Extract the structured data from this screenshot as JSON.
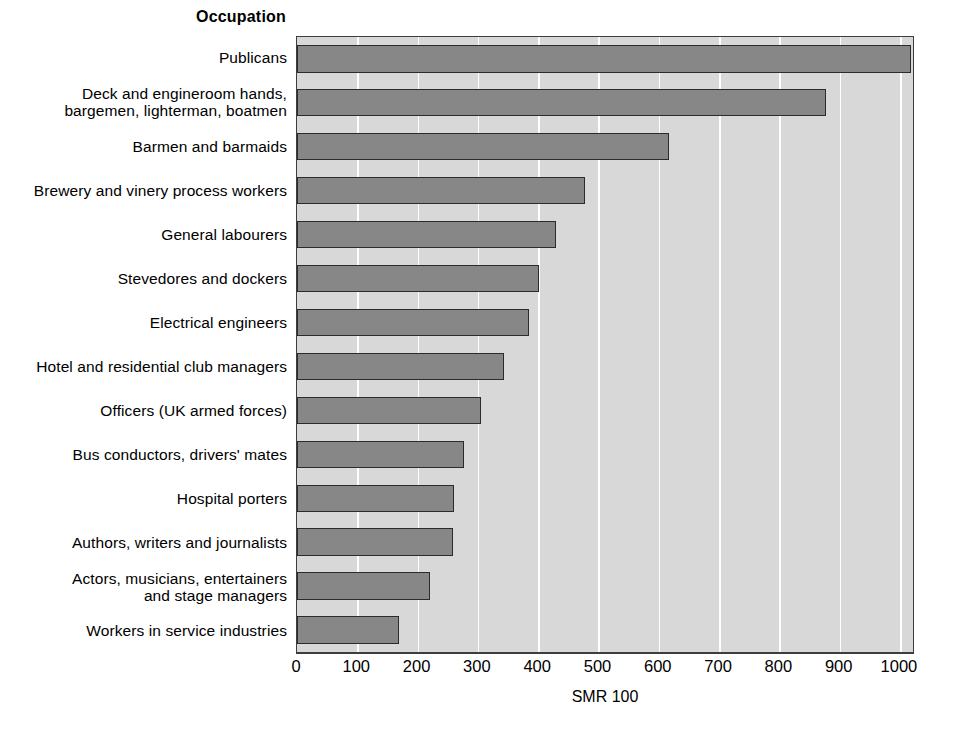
{
  "axes": {
    "category_axis_title": "Occupation",
    "x_axis_label": "SMR 100",
    "x_ticks": [
      "0",
      "100",
      "200",
      "300",
      "400",
      "500",
      "600",
      "700",
      "800",
      "900",
      "1000"
    ]
  },
  "colors": {
    "bar_fill": "#878787",
    "bar_border": "#2b2b2b",
    "plot_background": "#d8d8d8",
    "gridline": "#ffffff",
    "axis": "#3d3d3d",
    "text": "#000000"
  },
  "chart_data": {
    "type": "bar",
    "orientation": "horizontal",
    "title": "",
    "xlabel": "SMR 100",
    "ylabel": "Occupation",
    "xlim": [
      0,
      1020
    ],
    "xticks": [
      0,
      100,
      200,
      300,
      400,
      500,
      600,
      700,
      800,
      900,
      1000
    ],
    "grid": true,
    "legend": false,
    "categories": [
      "Publicans",
      "Deck and engineroom hands,\nbargemen, lighterman, boatmen",
      "Barmen and barmaids",
      "Brewery and vinery process workers",
      "General labourers",
      "Stevedores and dockers",
      "Electrical engineers",
      "Hotel and residential club managers",
      "Officers (UK armed forces)",
      "Bus conductors, drivers' mates",
      "Hospital porters",
      "Authors, writers and journalists",
      "Actors, musicians, entertainers\nand stage managers",
      "Workers in service industries"
    ],
    "values": [
      1018,
      878,
      617,
      478,
      429,
      402,
      384,
      344,
      305,
      277,
      261,
      259,
      220,
      169
    ]
  }
}
